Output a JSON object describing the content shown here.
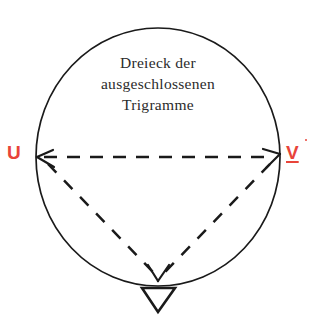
{
  "diagram": {
    "title_lines": [
      "Dreieck der",
      "ausgeschlossenen",
      "Trigramme"
    ],
    "caption_full": "Dreieck der ausgeschlossenen Trigramme",
    "vertices": [
      {
        "id": "left",
        "label": "U",
        "color": "#e8443a",
        "x": 36,
        "y": 157
      },
      {
        "id": "right",
        "label": "V",
        "color": "#e8443a",
        "x": 279,
        "y": 157
      },
      {
        "id": "bottom",
        "label": "∇",
        "color": "#1a1a1a",
        "x": 158,
        "y": 278
      }
    ],
    "circle": {
      "center_x": 158,
      "center_y": 157,
      "radius_x": 122,
      "radius_y": 128,
      "stroke": "#1a1a1a",
      "stroke_width": 1.6,
      "fill": "none"
    },
    "edges": [
      {
        "id": "top-edge",
        "from": "left",
        "to": "right",
        "style": "dashed",
        "arrows": "both"
      },
      {
        "id": "left-edge",
        "from": "left",
        "to": "bottom",
        "style": "dashed",
        "arrows": "end"
      },
      {
        "id": "right-edge",
        "from": "right",
        "to": "bottom",
        "style": "dashed",
        "arrows": "none"
      }
    ],
    "nabla_symbol": "∇",
    "colors": {
      "ink": "#1a1a1a",
      "text": "#2b2b2b",
      "accent_red": "#e8443a",
      "background": "#ffffff"
    }
  }
}
